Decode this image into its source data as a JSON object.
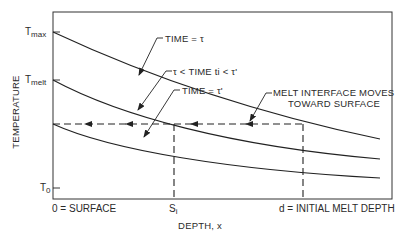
{
  "diagram": {
    "y_axis_label": "TEMPERATURE",
    "x_axis_label": "DEPTH, x",
    "y_ticks": {
      "t_max": {
        "main": "T",
        "sub": "max"
      },
      "t_melt": {
        "main": "T",
        "sub": "melt"
      },
      "t_0": {
        "main": "T",
        "sub": "0"
      }
    },
    "x_ticks": {
      "surface": "0 = SURFACE",
      "s_i": {
        "main": "S",
        "sub": "i"
      },
      "d": "d = INITIAL MELT DEPTH"
    },
    "curve_labels": {
      "time_tau": "TIME = τ",
      "time_between": "τ < TIME ti < τ'",
      "time_tau_prime": "TIME = τ'"
    },
    "annotation": {
      "line1": "MELT INTERFACE MOVES",
      "line2": "TOWARD SURFACE"
    },
    "colors": {
      "line": "#222222",
      "background": "#ffffff"
    }
  }
}
